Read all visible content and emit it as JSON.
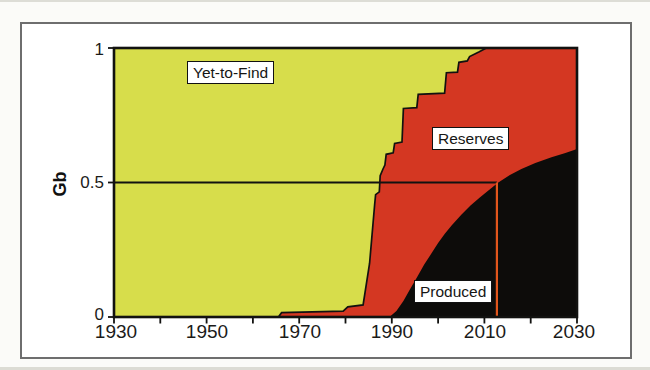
{
  "figure": {
    "background": "#fbfbf8",
    "frame_color": "#6e6e6e"
  },
  "chart_data": {
    "type": "area",
    "title": "",
    "xlabel": "",
    "ylabel": "Gb",
    "xlim": [
      1930,
      2030
    ],
    "ylim": [
      0,
      1
    ],
    "grid": false,
    "x_ticks_labeled": [
      1930,
      1950,
      1970,
      1990,
      2010,
      2030
    ],
    "x_ticks_minor": [
      1940,
      1960,
      1980,
      2000,
      2020
    ],
    "y_ticks": [
      0,
      0.5,
      1
    ],
    "y_tick_labels": [
      "0",
      "0.5",
      "1"
    ],
    "regions": [
      {
        "name": "Yet-to-Find",
        "color": "#d7dd4b",
        "description": "area above cumulative-discovery curve"
      },
      {
        "name": "Reserves",
        "color": "#d43722",
        "description": "area between discovery and production curves"
      },
      {
        "name": "Produced",
        "color": "#0d0c0a",
        "description": "area below cumulative-production curve"
      }
    ],
    "series": [
      {
        "name": "cumulative_discovered_Gb",
        "style": "stepped, black outline",
        "points": [
          [
            1965.5,
            0
          ],
          [
            1966.2,
            0.016
          ],
          [
            1979.5,
            0.022
          ],
          [
            1980.5,
            0.038
          ],
          [
            1983.8,
            0.045
          ],
          [
            1984.3,
            0.1
          ],
          [
            1985.2,
            0.2
          ],
          [
            1986.3,
            0.42
          ],
          [
            1986.5,
            0.455
          ],
          [
            1987.3,
            0.465
          ],
          [
            1987.5,
            0.525
          ],
          [
            1988.1,
            0.55
          ],
          [
            1988.5,
            0.565
          ],
          [
            1988.8,
            0.605
          ],
          [
            1990.3,
            0.61
          ],
          [
            1990.6,
            0.645
          ],
          [
            1992.2,
            0.65
          ],
          [
            1992.5,
            0.775
          ],
          [
            1995.4,
            0.778
          ],
          [
            1995.7,
            0.828
          ],
          [
            2001.4,
            0.832
          ],
          [
            2001.8,
            0.908
          ],
          [
            2004.2,
            0.91
          ],
          [
            2004.5,
            0.947
          ],
          [
            2006.3,
            0.952
          ],
          [
            2006.8,
            0.968
          ],
          [
            2008.8,
            0.985
          ],
          [
            2010.4,
            1.0
          ],
          [
            2030,
            1.0
          ]
        ]
      },
      {
        "name": "cumulative_produced_Gb",
        "style": "smooth s-curve",
        "points": [
          [
            1989.5,
            0
          ],
          [
            1991,
            0.022
          ],
          [
            1992.5,
            0.06
          ],
          [
            1994,
            0.105
          ],
          [
            1995.5,
            0.15
          ],
          [
            1997,
            0.195
          ],
          [
            1998.5,
            0.235
          ],
          [
            2000,
            0.275
          ],
          [
            2001.5,
            0.31
          ],
          [
            2003,
            0.342
          ],
          [
            2005,
            0.38
          ],
          [
            2007,
            0.414
          ],
          [
            2009,
            0.444
          ],
          [
            2011,
            0.472
          ],
          [
            2013,
            0.5
          ],
          [
            2015.5,
            0.528
          ],
          [
            2018,
            0.55
          ],
          [
            2021,
            0.572
          ],
          [
            2024.5,
            0.594
          ],
          [
            2027.5,
            0.61
          ],
          [
            2030,
            0.625
          ]
        ]
      }
    ],
    "reference_lines": {
      "horizontal_midpoint": {
        "value": 0.5,
        "x_start": 1930,
        "x_end": 2012.7,
        "color": "#121210"
      },
      "vertical_midpoint_year": {
        "year": 2012.7,
        "y_start": 0,
        "y_end": 0.5,
        "color": "#e2561c"
      }
    },
    "line_colors": {
      "axis_and_outline": "#121210"
    }
  }
}
